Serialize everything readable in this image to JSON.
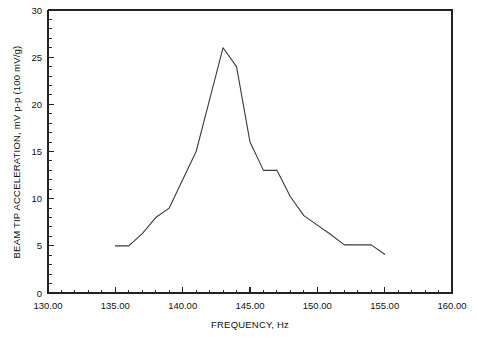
{
  "chart_data": {
    "type": "line",
    "title": "",
    "xlabel": "FREQUENCY, Hz",
    "ylabel": "BEAM TIP ACCELERATION, mV p-p (100 mV/g)",
    "xlim": [
      130.0,
      160.0
    ],
    "ylim": [
      0,
      30
    ],
    "xticks": [
      130.0,
      135.0,
      140.0,
      145.0,
      150.0,
      155.0,
      160.0
    ],
    "xticklabels": [
      "130.00",
      "135.00",
      "140.00",
      "145.00",
      "150.00",
      "155.00",
      "160.00"
    ],
    "yticks": [
      0,
      5,
      10,
      15,
      20,
      25,
      30
    ],
    "yticklabels": [
      "0",
      "5",
      "10",
      "15",
      "20",
      "25",
      "30"
    ],
    "x_minor_tick_step": 1.0,
    "y_minor_tick_step": 1.0,
    "grid": false,
    "legend": false,
    "line_color": "#3a3a3a",
    "series": [
      {
        "name": "Beam tip acceleration",
        "x": [
          135.0,
          136.0,
          137.0,
          138.0,
          139.0,
          140.0,
          141.0,
          142.0,
          143.0,
          144.0,
          145.0,
          146.0,
          147.0,
          148.0,
          149.0,
          150.0,
          151.0,
          152.0,
          154.0,
          155.0
        ],
        "values": [
          5.0,
          5.0,
          6.3,
          8.0,
          9.0,
          12.0,
          15.0,
          20.5,
          26.0,
          24.0,
          16.0,
          13.0,
          13.0,
          10.2,
          8.2,
          7.2,
          6.2,
          5.1,
          5.1,
          4.1
        ]
      }
    ],
    "peak": {
      "x": 143.0,
      "y": 26.0
    },
    "plateau": {
      "x_start": 146.0,
      "x_end": 147.0,
      "y": 13.0
    }
  },
  "figure": {
    "background_color": "#ffffff",
    "axis_color": "#222222"
  }
}
